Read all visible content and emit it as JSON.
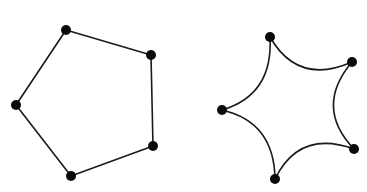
{
  "figure": {
    "width": 367,
    "height": 192,
    "background": "#ffffff",
    "stroke_color": "#1a1a1a",
    "node_color": "#0a0a0a",
    "node_radius": 5,
    "stroke_width": 1.6
  },
  "shapes": [
    {
      "name": "pentagon",
      "edge_style": "straight",
      "vertices": [
        [
          66,
          30
        ],
        [
          151,
          55
        ],
        [
          153,
          146
        ],
        [
          71,
          176
        ],
        [
          16,
          105
        ]
      ]
    },
    {
      "name": "curved-star",
      "edge_style": "concave-curve",
      "center": [
        290,
        108
      ],
      "curvature": 0.62,
      "vertices": [
        [
          270,
          37
        ],
        [
          352,
          62
        ],
        [
          354,
          149
        ],
        [
          275,
          179
        ],
        [
          222,
          110
        ]
      ]
    }
  ]
}
